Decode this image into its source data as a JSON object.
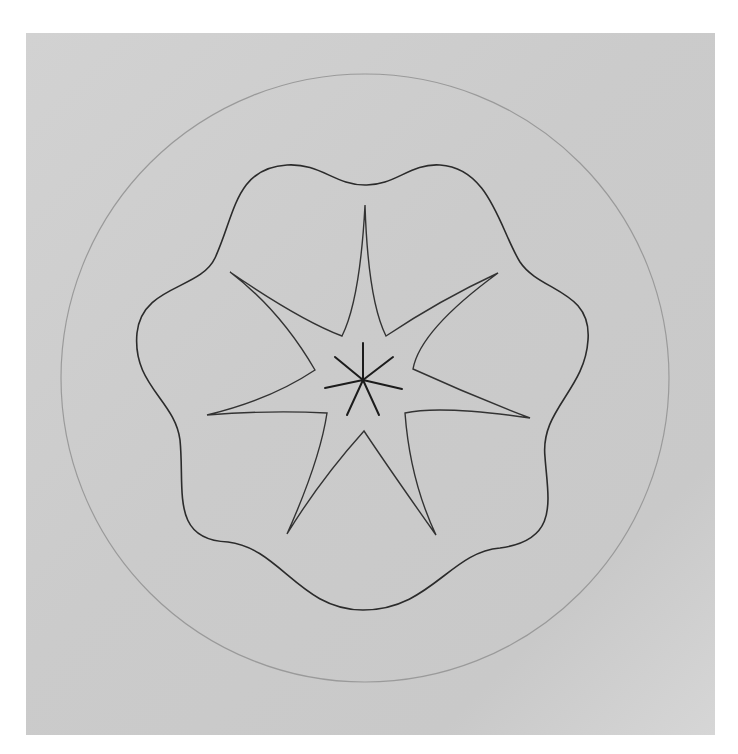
{
  "figure": {
    "colors": {
      "background": "#cdcdcd",
      "margin": "#ffffff",
      "circle_stroke": "#9a9a9a",
      "curve_stroke": "#2b2b2b",
      "asterisk_stroke": "#1c1c1c"
    },
    "outer_circle": {
      "cx": 365,
      "cy": 378,
      "r": 304
    },
    "center": {
      "x": 363,
      "y": 380
    },
    "symmetry_order": 7,
    "star_tips": [
      [
        365,
        205
      ],
      [
        498,
        273
      ],
      [
        530,
        418
      ],
      [
        436,
        535
      ],
      [
        287,
        534
      ],
      [
        207,
        415
      ],
      [
        230,
        272
      ]
    ],
    "star_inner_vertices": [
      [
        386,
        336
      ],
      [
        413,
        369
      ],
      [
        405,
        413
      ],
      [
        364,
        431
      ],
      [
        327,
        413
      ],
      [
        315,
        370
      ],
      [
        342,
        336
      ]
    ],
    "asterisk_arm_ends": [
      [
        363,
        343
      ],
      [
        393,
        357
      ],
      [
        402,
        389
      ],
      [
        379,
        415
      ],
      [
        347,
        415
      ],
      [
        325,
        388
      ],
      [
        335,
        357
      ]
    ]
  }
}
